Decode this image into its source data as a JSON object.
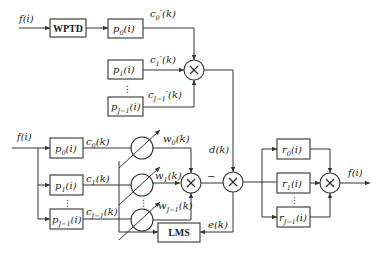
{
  "diagram": {
    "top": {
      "input_label": "f(i)",
      "wptd_label": "WPTD",
      "filters": [
        {
          "name": "p",
          "sub": "0",
          "arg": "(i)"
        },
        {
          "name": "p",
          "sub": "1",
          "arg": "(i)"
        },
        {
          "name": "p",
          "sub": "J−1",
          "arg": "(i)"
        }
      ],
      "coeffs": [
        {
          "name": "c",
          "sub": "0",
          "rest": "′(k)"
        },
        {
          "name": "c",
          "sub": "1",
          "rest": "′(k)"
        },
        {
          "name": "c",
          "sub": "J−1",
          "rest": "′(k)"
        }
      ],
      "multiplier": "×"
    },
    "bottom": {
      "input_label": "f(i)",
      "filters": [
        {
          "name": "p",
          "sub": "0",
          "arg": "(i)"
        },
        {
          "name": "p",
          "sub": "1",
          "arg": "(i)"
        },
        {
          "name": "p",
          "sub": "J−1",
          "arg": "(i)"
        }
      ],
      "coeffs": [
        {
          "name": "c",
          "sub": "0",
          "rest": "(k)"
        },
        {
          "name": "c",
          "sub": "1",
          "rest": "(k)"
        },
        {
          "name": "c",
          "sub": "J−1",
          "rest": "(k)"
        }
      ],
      "weights": [
        {
          "name": "w",
          "sub": "0",
          "rest": "(k)"
        },
        {
          "name": "w",
          "sub": "1",
          "rest": "(k)"
        },
        {
          "name": "w",
          "sub": "J−1",
          "rest": "(k)"
        }
      ],
      "lms_label": "LMS",
      "minus_sign": "−",
      "desired_label": "d(k)",
      "error_label": "e(k)",
      "multiplier": "×"
    },
    "reconstruction": {
      "filters": [
        {
          "name": "r",
          "sub": "0",
          "arg": "(i)"
        },
        {
          "name": "r",
          "sub": "1",
          "arg": "(i)"
        },
        {
          "name": "r",
          "sub": "J−1",
          "arg": "(i)"
        }
      ],
      "output_label": "f(i)",
      "multiplier": "×"
    },
    "ellipsis": "⋮"
  }
}
